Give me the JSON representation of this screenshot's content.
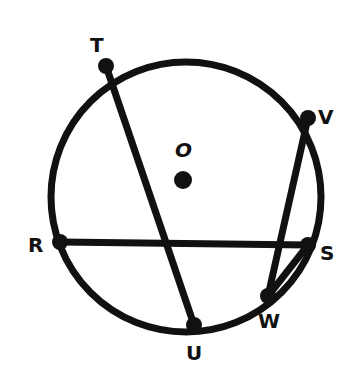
{
  "diagram": {
    "center_label": "O",
    "points": [
      {
        "id": "T",
        "label": "T"
      },
      {
        "id": "V",
        "label": "V"
      },
      {
        "id": "R",
        "label": "R"
      },
      {
        "id": "S",
        "label": "S"
      },
      {
        "id": "W",
        "label": "W"
      },
      {
        "id": "U",
        "label": "U"
      }
    ],
    "segments": [
      "TU",
      "RS",
      "VW",
      "WS"
    ],
    "stroke_color": "#111111"
  }
}
